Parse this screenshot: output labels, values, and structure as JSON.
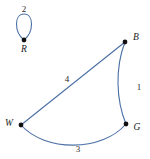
{
  "figure": {
    "background_color": "#ffffff",
    "edge_color": "#4a6fa5",
    "node_color": "#111111",
    "label_color": "#1b1b1b"
  },
  "graph": {
    "nodes": [
      {
        "id": "R",
        "label": "R",
        "x": 24,
        "y": 40,
        "label_x": 24,
        "label_y": 50
      },
      {
        "id": "B",
        "label": "B",
        "x": 125,
        "y": 42,
        "label_x": 136,
        "label_y": 38
      },
      {
        "id": "W",
        "label": "W",
        "x": 21,
        "y": 125,
        "label_x": 9,
        "label_y": 124
      },
      {
        "id": "G",
        "label": "G",
        "x": 126,
        "y": 124,
        "label_x": 137,
        "label_y": 128
      }
    ],
    "edges": [
      {
        "id": "R-R",
        "from": "R",
        "to": "R",
        "weight": "2",
        "kind": "self-loop",
        "label_x": 24,
        "label_y": 9
      },
      {
        "id": "W-B",
        "from": "W",
        "to": "B",
        "weight": "4",
        "kind": "straight",
        "label_x": 67,
        "label_y": 79
      },
      {
        "id": "B-G",
        "from": "B",
        "to": "G",
        "weight": "1",
        "kind": "curved",
        "label_x": 139,
        "label_y": 87
      },
      {
        "id": "W-G",
        "from": "W",
        "to": "G",
        "weight": "3",
        "kind": "curved",
        "label_x": 78,
        "label_y": 149
      }
    ]
  }
}
